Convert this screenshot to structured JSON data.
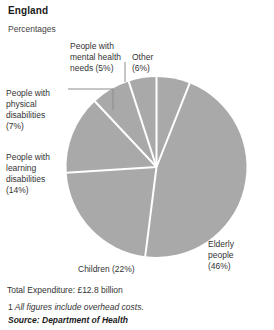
{
  "header": {
    "title": "England",
    "subtitle": "Percentages"
  },
  "labels": {
    "mental": "People with\nmental health\nneeds (5%)",
    "mental_line1": "People with",
    "mental_line2": "mental health",
    "mental_line3": "needs (5%)",
    "other_line1": "Other",
    "other_line2": "(6%)",
    "physical_line1": "People with",
    "physical_line2": "physical",
    "physical_line3": "disabilities",
    "physical_line4": "(7%)",
    "learning_line1": "People with",
    "learning_line2": "learning",
    "learning_line3": "disabilities",
    "learning_line4": "(14%)",
    "elderly_line1": "Elderly",
    "elderly_line2": "people",
    "elderly_line3": "(46%)",
    "children": "Children (22%)"
  },
  "footer": {
    "total": "Total Expenditure: £12.8 billion",
    "footnote_num": "1",
    "footnote_text": "All figures include overhead costs.",
    "source": "Source: Department of Health"
  },
  "colors": {
    "slice": "#a9a9a9",
    "separator": "#ffffff",
    "leader": "#8c8c8c",
    "text": "#333333"
  },
  "chart_data": {
    "type": "pie",
    "title": "England",
    "subtitle": "Percentages",
    "unit": "percent",
    "categories": [
      "Other",
      "Elderly people",
      "Children",
      "People with learning disabilities",
      "People with physical disabilities",
      "People with mental health needs"
    ],
    "values": [
      6,
      46,
      22,
      14,
      7,
      5
    ],
    "start_angle_deg": 0,
    "direction": "clockwise",
    "legend": "none",
    "labels_mode": "callout",
    "total_expenditure": "£12.8 billion",
    "footnote": "1 All figures include overhead costs.",
    "source": "Department of Health"
  }
}
